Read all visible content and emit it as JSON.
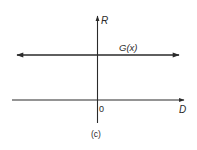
{
  "diagram": {
    "caption": "(c)",
    "axes": {
      "vertical": {
        "label": "R"
      },
      "horizontal": {
        "label": "D",
        "origin_label": "0"
      }
    },
    "curves": [
      {
        "label": "G(x)",
        "type": "horizontal-line",
        "bidirectional": true
      }
    ],
    "colors": {
      "ink": "#2a2a2a",
      "background": "#ffffff"
    }
  }
}
